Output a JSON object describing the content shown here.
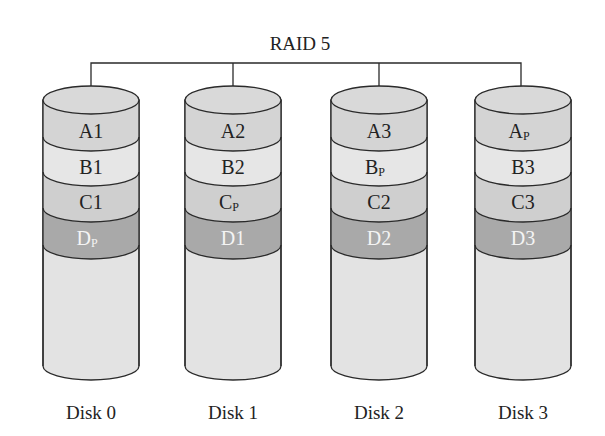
{
  "title": "RAID 5",
  "colors": {
    "stroke": "#2a2a2a",
    "fill_top": "#d9d9d9",
    "fill_a": "#d4d4d4",
    "fill_b": "#e6e6e6",
    "fill_c": "#cfcfcf",
    "fill_d": "#aaaaaa",
    "fill_body": "#e3e3e3"
  },
  "disks": [
    {
      "label": "Disk 0",
      "blocks": [
        {
          "main": "A",
          "sub": "1",
          "parity": false
        },
        {
          "main": "B",
          "sub": "1",
          "parity": false
        },
        {
          "main": "C",
          "sub": "1",
          "parity": false
        },
        {
          "main": "D",
          "sub": "P",
          "parity": true
        }
      ]
    },
    {
      "label": "Disk 1",
      "blocks": [
        {
          "main": "A",
          "sub": "2",
          "parity": false
        },
        {
          "main": "B",
          "sub": "2",
          "parity": false
        },
        {
          "main": "C",
          "sub": "P",
          "parity": true
        },
        {
          "main": "D",
          "sub": "1",
          "parity": false
        }
      ]
    },
    {
      "label": "Disk 2",
      "blocks": [
        {
          "main": "A",
          "sub": "3",
          "parity": false
        },
        {
          "main": "B",
          "sub": "P",
          "parity": true
        },
        {
          "main": "C",
          "sub": "2",
          "parity": false
        },
        {
          "main": "D",
          "sub": "2",
          "parity": false
        }
      ]
    },
    {
      "label": "Disk 3",
      "blocks": [
        {
          "main": "A",
          "sub": "P",
          "parity": true
        },
        {
          "main": "B",
          "sub": "3",
          "parity": false
        },
        {
          "main": "C",
          "sub": "3",
          "parity": false
        },
        {
          "main": "D",
          "sub": "3",
          "parity": false
        }
      ]
    }
  ],
  "cell_text": {
    "d0": [
      "A1",
      "B1",
      "C1",
      "D"
    ],
    "d0_sub": [
      "",
      "",
      "",
      "P"
    ],
    "d1": [
      "A2",
      "B2",
      "C",
      "D1"
    ],
    "d1_sub": [
      "",
      "",
      "P",
      ""
    ],
    "d2": [
      "A3",
      "B",
      "C2",
      "D2"
    ],
    "d2_sub": [
      "",
      "P",
      "",
      ""
    ],
    "d3": [
      "A",
      "B3",
      "C3",
      "D3"
    ],
    "d3_sub": [
      "P",
      "",
      "",
      ""
    ]
  }
}
